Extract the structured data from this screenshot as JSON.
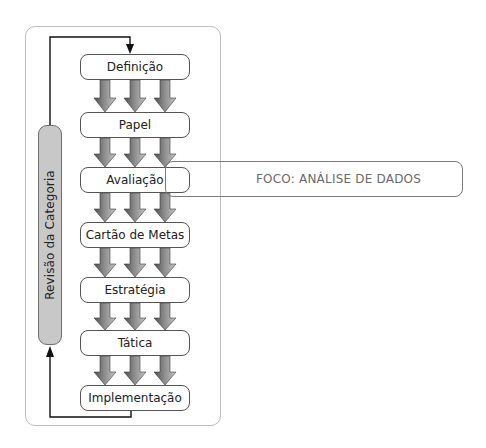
{
  "diagram": {
    "steps": [
      {
        "label": "Definição",
        "top": 54
      },
      {
        "label": "Papel",
        "top": 112
      },
      {
        "label": "Avaliação",
        "top": 167
      },
      {
        "label": "Cartão de Metas",
        "top": 222
      },
      {
        "label": "Estratégia",
        "top": 277
      },
      {
        "label": "Tática",
        "top": 330
      },
      {
        "label": "Implementação",
        "top": 385
      }
    ],
    "side_bar_label": "Revisão da Categoria",
    "focus_label": "FOCO: ANÁLISE DE DADOS",
    "colors": {
      "arrow_dark": "#5a5a5a",
      "arrow_light": "#b0b0b0",
      "side_bar_fill": "#c8c8c8",
      "container_border": "#bdbdbd",
      "focus_text": "#6a6a6a"
    }
  }
}
